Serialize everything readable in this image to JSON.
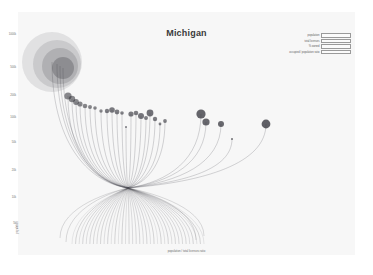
{
  "chart_data": {
    "type": "scatter",
    "title": "Michigan",
    "xlabel": "population / total licenses ratio",
    "ylabel": "population",
    "grid": false,
    "legend_position": "top-right",
    "y_ticks": [
      "1000k",
      "500k",
      "200k",
      "100k",
      "50k",
      "20k",
      "10k",
      "5k"
    ],
    "legend_entries": [
      {
        "label": "population",
        "swatch": "bar"
      },
      {
        "label": "total licenses",
        "swatch": "bar"
      },
      {
        "label": "% owned",
        "swatch": "bar"
      },
      {
        "label": "occupied / population ratio",
        "swatch": "bar"
      }
    ],
    "series": [
      {
        "name": "cities",
        "note": "bubble area encodes population; x encodes population / total licenses ratio; thin stems connect each bubble to a shared convergence node",
        "points": [
          {
            "x": 52,
            "y": 62,
            "r": 30,
            "opacity": 0.1
          },
          {
            "x": 57,
            "y": 64,
            "r": 24,
            "opacity": 0.12
          },
          {
            "x": 60,
            "y": 66,
            "r": 18,
            "opacity": 0.16
          },
          {
            "x": 63,
            "y": 68,
            "r": 11,
            "opacity": 0.26
          },
          {
            "x": 68,
            "y": 96,
            "r": 3.6,
            "opacity": 0.55
          },
          {
            "x": 72,
            "y": 99,
            "r": 3.2,
            "opacity": 0.55
          },
          {
            "x": 76,
            "y": 102,
            "r": 2.9,
            "opacity": 0.55
          },
          {
            "x": 80,
            "y": 104,
            "r": 2.6,
            "opacity": 0.55
          },
          {
            "x": 85,
            "y": 106,
            "r": 2.3,
            "opacity": 0.55
          },
          {
            "x": 90,
            "y": 107,
            "r": 2.0,
            "opacity": 0.55
          },
          {
            "x": 95,
            "y": 108,
            "r": 1.8,
            "opacity": 0.55
          },
          {
            "x": 101,
            "y": 111,
            "r": 1.7,
            "opacity": 0.55
          },
          {
            "x": 107,
            "y": 111,
            "r": 2.2,
            "opacity": 0.6
          },
          {
            "x": 112,
            "y": 110,
            "r": 2.8,
            "opacity": 0.62
          },
          {
            "x": 117,
            "y": 112,
            "r": 2.4,
            "opacity": 0.6
          },
          {
            "x": 122,
            "y": 113,
            "r": 1.8,
            "opacity": 0.58
          },
          {
            "x": 126,
            "y": 127,
            "r": 1.0,
            "opacity": 0.6
          },
          {
            "x": 131,
            "y": 114,
            "r": 2.6,
            "opacity": 0.62
          },
          {
            "x": 136,
            "y": 113,
            "r": 2.3,
            "opacity": 0.6
          },
          {
            "x": 141,
            "y": 116,
            "r": 3.0,
            "opacity": 0.64
          },
          {
            "x": 146,
            "y": 118,
            "r": 2.0,
            "opacity": 0.58
          },
          {
            "x": 150,
            "y": 113,
            "r": 3.4,
            "opacity": 0.66
          },
          {
            "x": 155,
            "y": 119,
            "r": 2.2,
            "opacity": 0.6
          },
          {
            "x": 160,
            "y": 124,
            "r": 1.4,
            "opacity": 0.58
          },
          {
            "x": 165,
            "y": 121,
            "r": 1.9,
            "opacity": 0.58
          },
          {
            "x": 201,
            "y": 114,
            "r": 4.6,
            "opacity": 0.72
          },
          {
            "x": 206,
            "y": 122,
            "r": 3.6,
            "opacity": 0.7
          },
          {
            "x": 221,
            "y": 124,
            "r": 3.0,
            "opacity": 0.7
          },
          {
            "x": 232,
            "y": 139,
            "r": 1.0,
            "opacity": 0.65
          },
          {
            "x": 266,
            "y": 124,
            "r": 4.4,
            "opacity": 0.74
          }
        ],
        "convergence_node": {
          "x": 128,
          "y": 188
        }
      }
    ]
  }
}
